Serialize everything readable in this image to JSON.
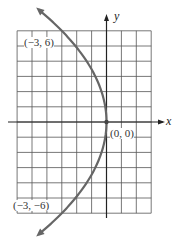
{
  "chart_data": {
    "type": "line",
    "title": "",
    "equation_form": "x = -y^2/12 (parabola opening left)",
    "xlabel": "x",
    "ylabel": "y",
    "grid": true,
    "xlim": [
      -6,
      3
    ],
    "ylim": [
      -6,
      6
    ],
    "series": [
      {
        "name": "parabola",
        "points": [
          [
            -3,
            6
          ],
          [
            0,
            0
          ],
          [
            -3,
            -6
          ]
        ],
        "arrows_at_ends": true
      }
    ],
    "annotations": [
      {
        "text": "(−3, 6)",
        "x": -3,
        "y": 6
      },
      {
        "text": "(0, 0)",
        "x": 0,
        "y": 0
      },
      {
        "text": "(−3, −6)",
        "x": -3,
        "y": -6
      }
    ]
  },
  "labels": {
    "x_axis": "x",
    "y_axis": "y",
    "point_top": "(−3, 6)",
    "point_origin": "(0, 0)",
    "point_bottom": "(−3, −6)"
  },
  "colors": {
    "curve": "#666666",
    "grid": "#555555",
    "axis": "#222222"
  }
}
